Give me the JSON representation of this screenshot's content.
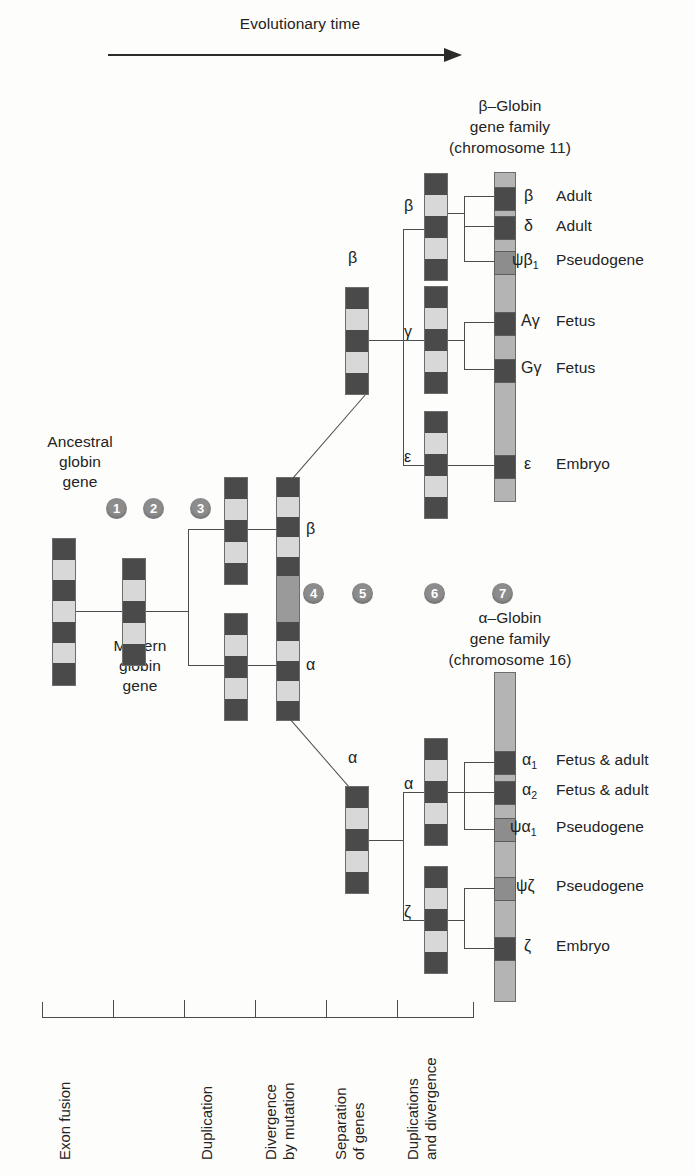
{
  "header": {
    "arrow_label": "Evolutionary time"
  },
  "families": {
    "beta": {
      "title_line1": "β–Globin",
      "title_line2": "gene family",
      "title_line3": "(chromosome 11)",
      "genes": [
        {
          "symbol": "β",
          "sub": "",
          "expression": "Adult",
          "shade": "dark"
        },
        {
          "symbol": "δ",
          "sub": "",
          "expression": "Adult",
          "shade": "dark"
        },
        {
          "symbol": "ψβ",
          "sub": "1",
          "expression": "Pseudogene",
          "shade": "mid"
        },
        {
          "symbol": "Aγ",
          "sub": "",
          "expression": "Fetus",
          "shade": "dark"
        },
        {
          "symbol": "Gγ",
          "sub": "",
          "expression": "Fetus",
          "shade": "dark"
        },
        {
          "symbol": "ε",
          "sub": "",
          "expression": "Embryo",
          "shade": "dark"
        }
      ]
    },
    "alpha": {
      "title_line1": "α–Globin",
      "title_line2": "gene family",
      "title_line3": "(chromosome 16)",
      "genes": [
        {
          "symbol": "α",
          "sub": "1",
          "expression": "Fetus & adult",
          "shade": "dark"
        },
        {
          "symbol": "α",
          "sub": "2",
          "expression": "Fetus & adult",
          "shade": "dark"
        },
        {
          "symbol": "ψα",
          "sub": "1",
          "expression": "Pseudogene",
          "shade": "mid"
        },
        {
          "symbol": "ψζ",
          "sub": "",
          "expression": "Pseudogene",
          "shade": "mid"
        },
        {
          "symbol": "ζ",
          "sub": "",
          "expression": "Embryo",
          "shade": "dark"
        }
      ]
    }
  },
  "left_labels": {
    "ancestral_l1": "Ancestral",
    "ancestral_l2": "globin",
    "ancestral_l3": "gene",
    "modern_l1": "Modern",
    "modern_l2": "globin",
    "modern_l3": "gene"
  },
  "branch_labels": {
    "step3_beta": "β",
    "step3_alpha": "α",
    "step5_beta": "β",
    "step5_alpha": "α",
    "step6_beta": "β",
    "step6_gamma": "γ",
    "step6_epsilon": "ε",
    "step6_alpha": "α",
    "step6_zeta": "ζ"
  },
  "steps": [
    {
      "n": "1"
    },
    {
      "n": "2"
    },
    {
      "n": "3"
    },
    {
      "n": "4"
    },
    {
      "n": "5"
    },
    {
      "n": "6"
    },
    {
      "n": "7"
    }
  ],
  "timeline": {
    "events": [
      "Exon fusion",
      "Duplication",
      "Divergence\nby mutation",
      "Separation\nof genes",
      "Duplications\nand divergence"
    ]
  },
  "colors": {
    "exon_dark": "#4a4a4a",
    "intron_light": "#d8d8d8",
    "pseudogene_mid": "#9a9a9a",
    "chromosome": "#b4b4b4",
    "line": "#4d4d4d",
    "step_marker": "#8c8c8c"
  }
}
